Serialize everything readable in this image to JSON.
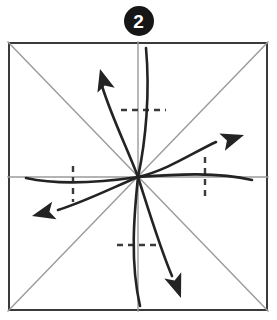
{
  "figure": {
    "kind": "origami-fold-diagram",
    "step_badge": {
      "icon": "filled-circle-number-badge",
      "label": "2",
      "fill_color": "#161616",
      "text_color": "#ffffff"
    },
    "canvas": {
      "width": 277,
      "height": 320,
      "background": "#ffffff"
    },
    "paper": {
      "name": "square-sheet",
      "left": 8,
      "top": 42,
      "width": 260,
      "height": 269,
      "border_color": "#3a3a3a",
      "border_width": 2,
      "fill": "#ffffff"
    },
    "center_point": {
      "x": 138,
      "y": 177
    },
    "crease_lines": {
      "color": "#9a9a9a",
      "width": 1.4,
      "items": [
        {
          "name": "diagonal-tl-br",
          "x1": 8,
          "y1": 42,
          "x2": 268,
          "y2": 311
        },
        {
          "name": "diagonal-bl-tr",
          "x1": 8,
          "y1": 311,
          "x2": 268,
          "y2": 42
        },
        {
          "name": "vertical-midline",
          "x1": 138,
          "y1": 42,
          "x2": 138,
          "y2": 311
        },
        {
          "name": "horizontal-midline",
          "x1": 8,
          "y1": 177,
          "x2": 268,
          "y2": 177
        }
      ]
    },
    "dashed_marks": {
      "color": "#3a3a3a",
      "width": 2.4,
      "dash_pattern": "6 5",
      "items": [
        {
          "name": "dash-upper-horizontal",
          "x1": 121,
          "y1": 110,
          "x2": 166,
          "y2": 110
        },
        {
          "name": "dash-lower-horizontal",
          "x1": 117,
          "y1": 245,
          "x2": 161,
          "y2": 245
        },
        {
          "name": "dash-left-vertical",
          "x1": 73,
          "y1": 166,
          "x2": 73,
          "y2": 202
        },
        {
          "name": "dash-right-vertical",
          "x1": 205,
          "y1": 157,
          "x2": 205,
          "y2": 199
        }
      ]
    },
    "motion_curves": {
      "color": "#232323",
      "width": 2.6,
      "arrowhead_color": "#232323",
      "items": [
        {
          "name": "curve-arrow-up-left",
          "has_arrowhead": true,
          "path": "M138,177 C128,150 112,118 102,86",
          "arrow_tip": {
            "x": 100,
            "y": 70
          },
          "arrow_angle_deg": -105
        },
        {
          "name": "curve-plain-up",
          "has_arrowhead": false,
          "path": "M138,177 C146,140 150,92 146,48"
        },
        {
          "name": "curve-arrow-right",
          "has_arrowhead": true,
          "path": "M138,177 C168,170 194,152 216,142"
        },
        {
          "name": "curve-plain-right",
          "has_arrowhead": false,
          "path": "M138,177 C178,174 218,172 252,180"
        },
        {
          "name": "curve-arrow-left",
          "has_arrowhead": true,
          "path": "M138,177 C112,188 84,202 58,210"
        },
        {
          "name": "curve-plain-left",
          "has_arrowhead": false,
          "path": "M138,177 C104,182 62,186 26,178"
        },
        {
          "name": "curve-arrow-down",
          "has_arrowhead": true,
          "path": "M138,177 C148,208 160,248 172,276"
        },
        {
          "name": "curve-plain-down",
          "has_arrowhead": false,
          "path": "M138,177 C134,216 130,262 140,306"
        }
      ]
    },
    "arrowheads": [
      {
        "name": "arrowhead-up-left",
        "tip_x": 100,
        "tip_y": 69,
        "rotation": -106,
        "length": 22,
        "half_width": 9
      },
      {
        "name": "arrowhead-right",
        "tip_x": 244,
        "tip_y": 135,
        "rotation": -18,
        "length": 23,
        "half_width": 9
      },
      {
        "name": "arrowhead-left",
        "tip_x": 32,
        "tip_y": 216,
        "rotation": 166,
        "length": 23,
        "half_width": 9
      },
      {
        "name": "arrowhead-down",
        "tip_x": 181,
        "tip_y": 298,
        "rotation": 70,
        "length": 24,
        "half_width": 9
      }
    ]
  }
}
